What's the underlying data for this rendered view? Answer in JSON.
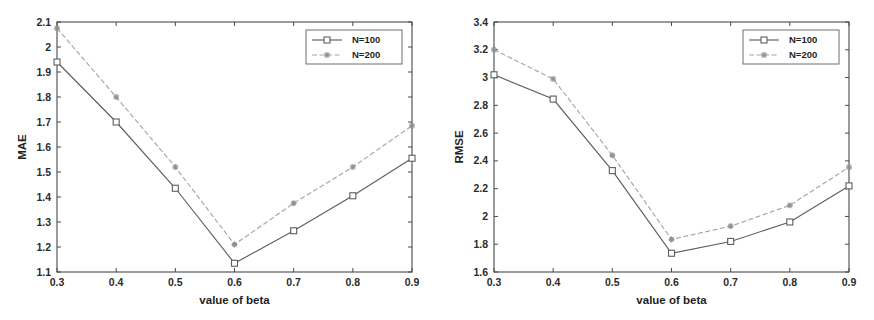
{
  "figure": {
    "background": "#ffffff",
    "line_color_n100": "#5e5e5e",
    "line_color_n200": "#a6a6a6",
    "axis_color": "#4a4a4a"
  },
  "chart_data": [
    {
      "id": "mae-chart",
      "type": "line",
      "title": "",
      "xlabel": "value of beta",
      "ylabel": "MAE",
      "x": [
        0.3,
        0.4,
        0.5,
        0.6,
        0.7,
        0.8,
        0.9
      ],
      "xticklabels": [
        "0.3",
        "0.4",
        "0.5",
        "0.6",
        "0.7",
        "0.8",
        "0.9"
      ],
      "yticks": [
        1.1,
        1.2,
        1.3,
        1.4,
        1.5,
        1.6,
        1.7,
        1.8,
        1.9,
        2.0,
        2.1
      ],
      "yticklabels": [
        "1.1",
        "1.2",
        "1.3",
        "1.4",
        "1.5",
        "1.6",
        "1.7",
        "1.8",
        "1.9",
        "2",
        "2.1"
      ],
      "xlim": [
        0.3,
        0.9
      ],
      "ylim": [
        1.1,
        2.1
      ],
      "grid": false,
      "legend_position": "upper right",
      "series": [
        {
          "name": "N=100",
          "marker": "square",
          "linestyle": "solid",
          "values": [
            1.94,
            1.7,
            1.435,
            1.135,
            1.265,
            1.405,
            1.555
          ]
        },
        {
          "name": "N=200",
          "marker": "star",
          "linestyle": "dashed",
          "values": [
            2.075,
            1.8,
            1.52,
            1.21,
            1.375,
            1.52,
            1.685
          ]
        }
      ]
    },
    {
      "id": "rmse-chart",
      "type": "line",
      "title": "",
      "xlabel": "value of beta",
      "ylabel": "RMSE",
      "x": [
        0.3,
        0.4,
        0.5,
        0.6,
        0.7,
        0.8,
        0.9
      ],
      "xticklabels": [
        "0.3",
        "0.4",
        "0.5",
        "0.6",
        "0.7",
        "0.8",
        "0.9"
      ],
      "yticks": [
        1.6,
        1.8,
        2.0,
        2.2,
        2.4,
        2.6,
        2.8,
        3.0,
        3.2,
        3.4
      ],
      "yticklabels": [
        "1.6",
        "1.8",
        "2",
        "2.2",
        "2.4",
        "2.6",
        "2.8",
        "3",
        "3.2",
        "3.4"
      ],
      "xlim": [
        0.3,
        0.9
      ],
      "ylim": [
        1.6,
        3.4
      ],
      "grid": false,
      "legend_position": "upper right",
      "series": [
        {
          "name": "N=100",
          "marker": "square",
          "linestyle": "solid",
          "values": [
            3.02,
            2.845,
            2.33,
            1.735,
            1.82,
            1.96,
            2.22
          ]
        },
        {
          "name": "N=200",
          "marker": "star",
          "linestyle": "dashed",
          "values": [
            3.2,
            2.99,
            2.44,
            1.835,
            1.93,
            2.08,
            2.355
          ]
        }
      ]
    }
  ]
}
